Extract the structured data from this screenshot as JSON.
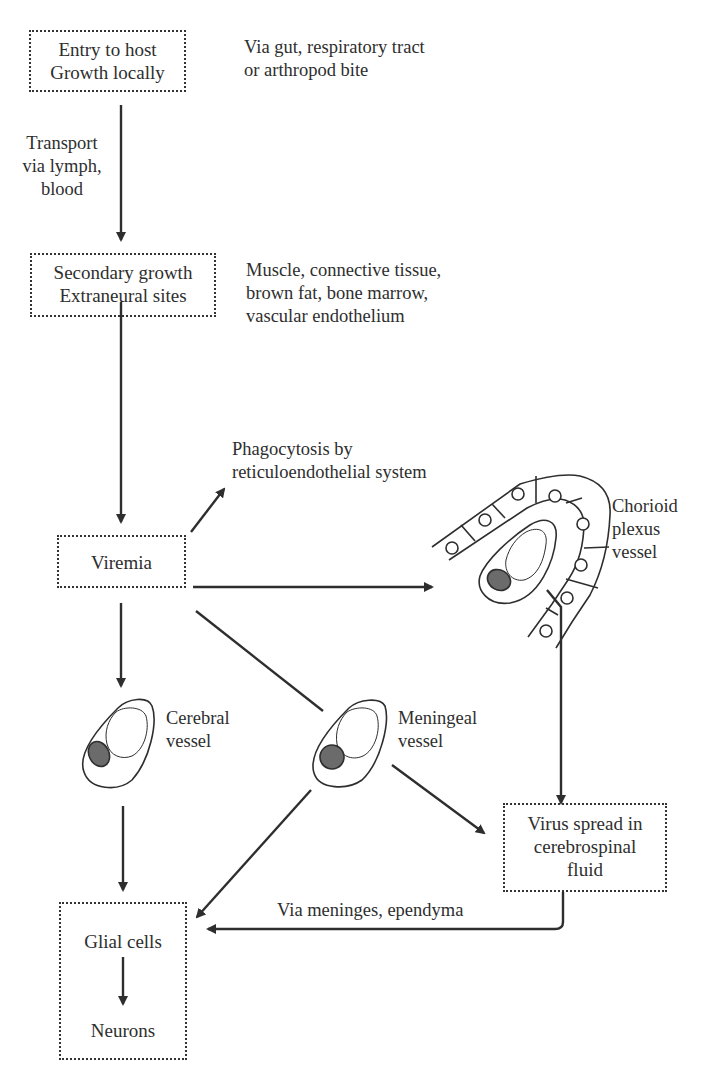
{
  "diagram": {
    "nodes": {
      "entry": {
        "line1": "Entry to host",
        "line2": "Growth locally"
      },
      "secondary": {
        "line1": "Secondary growth",
        "line2": "Extraneural sites"
      },
      "viremia": {
        "label": "Viremia"
      },
      "csf": {
        "line1": "Virus spread in",
        "line2": "cerebrospinal",
        "line3": "fluid"
      },
      "glial": {
        "label": "Glial cells"
      },
      "neurons": {
        "label": "Neurons"
      }
    },
    "annotations": {
      "entry_routes": {
        "line1": "Via gut, respiratory tract",
        "line2": "or arthropod bite"
      },
      "transport": {
        "line1": "Transport",
        "line2": "via lymph,",
        "line3": "blood"
      },
      "secondary_sites": {
        "line1": "Muscle, connective tissue,",
        "line2": "brown fat, bone marrow,",
        "line3": "vascular endothelium"
      },
      "phagocytosis": {
        "line1": "Phagocytosis by",
        "line2": "reticuloendothelial system"
      },
      "chorioid": {
        "line1": "Chorioid",
        "line2": "plexus",
        "line3": "vessel"
      },
      "cerebral": {
        "line1": "Cerebral",
        "line2": "vessel"
      },
      "meningeal": {
        "line1": "Meningeal",
        "line2": "vessel"
      },
      "meninges_route": {
        "label": "Via meninges, ependyma"
      }
    },
    "colors": {
      "ink": "#2e2e2e",
      "nucleus": "#6b6b6b",
      "background": "#ffffff"
    }
  }
}
